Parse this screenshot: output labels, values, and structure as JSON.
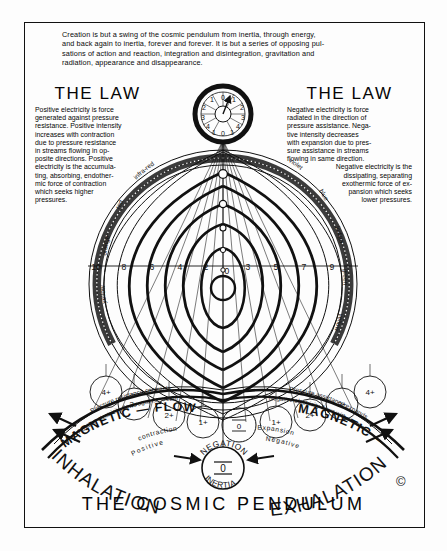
{
  "intro": {
    "lines": [
      "Creation is but a swing of the cosmic pendulum from inertia, through energy,",
      "and back again to inertia, forever and forever. It is but a series of opposing pul-",
      "sations of action and reaction, integration and disintegration, gravitation and",
      "radiation, appearance and disappearance."
    ]
  },
  "law_left": {
    "heading": "THE LAW",
    "lines": [
      "Positive electricity is force",
      "generated against pressure",
      "resistance. Positive intensity",
      "increases with contraction",
      "due to pressure resistance",
      "in streams flowing in op-",
      "posite directions. Positive",
      "electricity is the accumula-",
      "ting, absorbing, endother-",
      "mic force of contraction",
      "which seeks higher",
      "pressures."
    ]
  },
  "law_right": {
    "heading": "THE LAW",
    "lines": [
      "Negative electricity is force",
      "radiated in the direction of",
      "pressure assistance. Nega-",
      "tive intensity decreases",
      "with expansion due to pres-",
      "sure assistance in streams",
      "flowing in same direction.",
      "Negative electricity is the",
      "dissipating, separating",
      "exothermic force of ex-",
      "pansion which seeks",
      "lower pressures."
    ]
  },
  "pendulum_dial": {
    "left_numbers": [
      "4",
      "3",
      "2",
      "1"
    ],
    "top_number": "0",
    "right_numbers": [
      "1",
      "2",
      "3",
      "4"
    ],
    "bottom_numbers": [
      "1",
      "0",
      "1"
    ]
  },
  "scale": {
    "left_values": [
      "10",
      "8",
      "6",
      "4",
      "2"
    ],
    "center_value": "0",
    "right_values": [
      "3",
      "5",
      "7",
      "9"
    ]
  },
  "spectrum": {
    "left_labels": [
      "infra-red",
      "red",
      "orange",
      "yellow"
    ],
    "right_labels": [
      "violet",
      "blue",
      "indigo",
      "green",
      "yellow"
    ]
  },
  "base_circles": {
    "left": [
      "4+",
      "3+",
      "2+",
      "1+"
    ],
    "center": "0",
    "right": [
      "1+",
      "2+",
      "3+",
      "4+"
    ]
  },
  "bands": {
    "left_outer": "Pressure resistance contracts",
    "left_inner": "Positive electricity flows against stream",
    "right_outer": "Pressure assistance expands",
    "right_inner": "Negative electricity flows with stream",
    "left_flow": "MAGNETIC — FLOW",
    "right_flow": "MAGNETIC — FLOW",
    "left_sub1": "contraction",
    "left_sub2": "Positive",
    "right_sub1": "Expansion",
    "right_sub2": "Negative"
  },
  "center_node": {
    "above": "NEGATION",
    "below": "INERTIA",
    "value": "0"
  },
  "arcs": {
    "left": "INHALATION",
    "right": "EXHALATION"
  },
  "title": "THE COSMIC PENDULUM",
  "copyright": "©",
  "colors": {
    "ink": "#0a0a0a",
    "paper": "#fdfdfd",
    "band": "#2a2a2a"
  }
}
